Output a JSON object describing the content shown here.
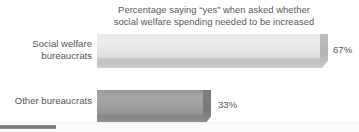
{
  "chart_data": {
    "type": "bar",
    "orientation": "horizontal",
    "title_lines": [
      "Percentage saying “yes” when asked whether",
      "social welfare spending needed to be increased"
    ],
    "title": "Percentage saying “yes” when asked whether social welfare spending needed to be increased",
    "categories": [
      "Social welfare\nbureaucrats",
      "Other bureaucrats"
    ],
    "values": [
      67,
      33
    ],
    "value_labels": [
      "67%",
      "33%"
    ],
    "xlabel": "",
    "ylabel": "",
    "xlim": [
      0,
      100
    ],
    "grid": false,
    "legend": false,
    "series": [
      {
        "name": "Percentage saying yes",
        "values": [
          67,
          33
        ]
      }
    ],
    "style": {
      "bar_1_fill": "#ebebeb",
      "bar_2_fill": "#a0a0a0",
      "bar_1_front": "#c6c6c6",
      "bar_2_front": "#888888",
      "text_color": "#555555",
      "background": "#ffffff",
      "three_d": true
    }
  },
  "artifacts": {
    "bottom_band_color": "#fbfbfb",
    "bottom_mark_color": "#7a7a7a"
  }
}
